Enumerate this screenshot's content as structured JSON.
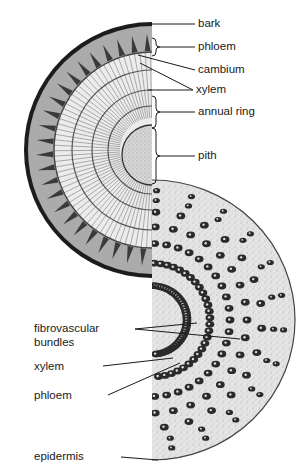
{
  "diagram": {
    "colors": {
      "bark": "#1c1c1c",
      "phloem_band": "#a9a9a9",
      "xylem_wood": "#e8e8e8",
      "ray_lines": "#777777",
      "annual_ring": "#555555",
      "pith": "#cfcfcf",
      "monocot_ground": "#e2e2e2",
      "bundle": "#2a2a2a",
      "label_text": "#1a1a1a"
    },
    "woody_stem_labels": [
      {
        "id": "bark",
        "text": "bark"
      },
      {
        "id": "phloem",
        "text": "phloem"
      },
      {
        "id": "cambium",
        "text": "cambium"
      },
      {
        "id": "xylem",
        "text": "xylem"
      },
      {
        "id": "annual-ring",
        "text": "annual ring"
      },
      {
        "id": "pith",
        "text": "pith"
      }
    ],
    "monocot_stem_labels": [
      {
        "id": "fibrovascular-bundles",
        "text": "fibrovascular bundles",
        "line1": "fibrovascular",
        "line2": "bundles"
      },
      {
        "id": "xylem",
        "text": "xylem"
      },
      {
        "id": "phloem",
        "text": "phloem"
      },
      {
        "id": "epidermis",
        "text": "epidermis"
      }
    ]
  }
}
